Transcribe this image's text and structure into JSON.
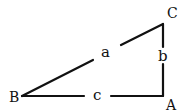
{
  "diagram": {
    "type": "right-triangle",
    "vertices": [
      {
        "id": "A",
        "label": "A"
      },
      {
        "id": "B",
        "label": "B"
      },
      {
        "id": "C",
        "label": "C"
      }
    ],
    "sides": [
      {
        "id": "a",
        "label": "a",
        "from": "B",
        "to": "C"
      },
      {
        "id": "b",
        "label": "b",
        "from": "C",
        "to": "A"
      },
      {
        "id": "c",
        "label": "c",
        "from": "B",
        "to": "A"
      }
    ],
    "colors": {
      "stroke": "#111111",
      "background": "#ffffff"
    }
  }
}
